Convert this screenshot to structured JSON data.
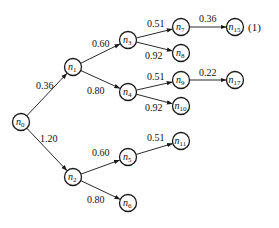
{
  "diagram": {
    "equation_number": "(1)",
    "nodes": [
      {
        "id": "n0",
        "base": "n",
        "sub": "0",
        "x": 21,
        "y": 122
      },
      {
        "id": "n1",
        "base": "n",
        "sub": "1",
        "x": 73,
        "y": 67
      },
      {
        "id": "n2",
        "base": "n",
        "sub": "2",
        "x": 73,
        "y": 177
      },
      {
        "id": "n3",
        "base": "n",
        "sub": "3",
        "x": 128,
        "y": 40
      },
      {
        "id": "n4",
        "base": "n",
        "sub": "4",
        "x": 128,
        "y": 92
      },
      {
        "id": "n5",
        "base": "n",
        "sub": "5",
        "x": 128,
        "y": 157
      },
      {
        "id": "n6",
        "base": "n",
        "sub": "6",
        "x": 128,
        "y": 203
      },
      {
        "id": "n7",
        "base": "n",
        "sub": "7",
        "x": 181,
        "y": 27
      },
      {
        "id": "n8",
        "base": "n",
        "sub": "8",
        "x": 181,
        "y": 53
      },
      {
        "id": "n9",
        "base": "n",
        "sub": "9",
        "x": 181,
        "y": 80
      },
      {
        "id": "n10",
        "base": "n",
        "sub": "10",
        "x": 181,
        "y": 106
      },
      {
        "id": "n11",
        "base": "n",
        "sub": "11",
        "x": 181,
        "y": 141
      },
      {
        "id": "n15",
        "base": "n",
        "sub": "15",
        "x": 235,
        "y": 27
      },
      {
        "id": "n17",
        "base": "n",
        "sub": "17",
        "x": 235,
        "y": 80
      }
    ],
    "edges": [
      {
        "from": "n0",
        "to": "n1",
        "label": "0.36",
        "lx": 36,
        "ly": 89
      },
      {
        "from": "n0",
        "to": "n2",
        "label": "1.20",
        "lx": 40,
        "ly": 142
      },
      {
        "from": "n1",
        "to": "n3",
        "label": "0.60",
        "lx": 92,
        "ly": 47
      },
      {
        "from": "n1",
        "to": "n4",
        "label": "0.80",
        "lx": 87,
        "ly": 94
      },
      {
        "from": "n2",
        "to": "n5",
        "label": "0.60",
        "lx": 92,
        "ly": 156
      },
      {
        "from": "n2",
        "to": "n6",
        "label": "0.80",
        "lx": 87,
        "ly": 203
      },
      {
        "from": "n3",
        "to": "n7",
        "label": "0.51",
        "lx": 147,
        "ly": 27
      },
      {
        "from": "n3",
        "to": "n8",
        "label": "0.92",
        "lx": 145,
        "ly": 59
      },
      {
        "from": "n4",
        "to": "n9",
        "label": "0.51",
        "lx": 147,
        "ly": 80
      },
      {
        "from": "n4",
        "to": "n10",
        "label": "0.92",
        "lx": 145,
        "ly": 111
      },
      {
        "from": "n5",
        "to": "n11",
        "label": "0.51",
        "lx": 147,
        "ly": 141
      },
      {
        "from": "n7",
        "to": "n15",
        "label": "0.36",
        "lx": 199,
        "ly": 22
      },
      {
        "from": "n9",
        "to": "n17",
        "label": "0.22",
        "lx": 199,
        "ly": 76
      }
    ]
  }
}
